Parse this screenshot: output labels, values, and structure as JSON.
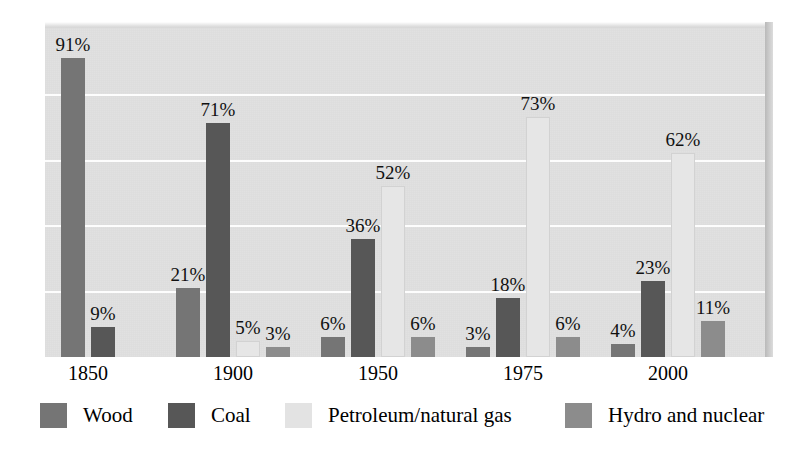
{
  "chart_data": {
    "type": "bar",
    "title": "",
    "subtitle": "",
    "xlabel": "",
    "ylabel": "",
    "ylim": [
      0,
      100
    ],
    "grid": true,
    "gridlines": [
      20,
      40,
      60,
      80
    ],
    "legend_position": "bottom",
    "value_suffix": "%",
    "categories": [
      "1850",
      "1900",
      "1950",
      "1975",
      "2000"
    ],
    "series": [
      {
        "name": "Wood",
        "color": "#757575",
        "values": [
          91,
          21,
          6,
          3,
          4
        ]
      },
      {
        "name": "Coal",
        "color": "#575757",
        "values": [
          9,
          71,
          36,
          18,
          23
        ]
      },
      {
        "name": "Petroleum/natural gas",
        "color": "#e6e6e6",
        "values": [
          null,
          5,
          52,
          73,
          62
        ]
      },
      {
        "name": "Hydro and nuclear",
        "color": "#8c8c8c",
        "values": [
          null,
          3,
          6,
          6,
          11
        ]
      }
    ],
    "groups": [
      {
        "category": "1850",
        "bars": [
          {
            "series": "Wood",
            "value": 91,
            "label": "91%"
          },
          {
            "series": "Coal",
            "value": 9,
            "label": "9%"
          }
        ]
      },
      {
        "category": "1900",
        "bars": [
          {
            "series": "Wood",
            "value": 21,
            "label": "21%"
          },
          {
            "series": "Coal",
            "value": 71,
            "label": "71%"
          },
          {
            "series": "Petroleum/natural gas",
            "value": 5,
            "label": "5%"
          },
          {
            "series": "Hydro and nuclear",
            "value": 3,
            "label": "3%"
          }
        ]
      },
      {
        "category": "1950",
        "bars": [
          {
            "series": "Wood",
            "value": 6,
            "label": "6%"
          },
          {
            "series": "Coal",
            "value": 36,
            "label": "36%"
          },
          {
            "series": "Petroleum/natural gas",
            "value": 52,
            "label": "52%"
          },
          {
            "series": "Hydro and nuclear",
            "value": 6,
            "label": "6%"
          }
        ]
      },
      {
        "category": "1975",
        "bars": [
          {
            "series": "Wood",
            "value": 3,
            "label": "3%"
          },
          {
            "series": "Coal",
            "value": 18,
            "label": "18%"
          },
          {
            "series": "Petroleum/natural gas",
            "value": 73,
            "label": "73%"
          },
          {
            "series": "Hydro and nuclear",
            "value": 6,
            "label": "6%"
          }
        ]
      },
      {
        "category": "2000",
        "bars": [
          {
            "series": "Wood",
            "value": 4,
            "label": "4%"
          },
          {
            "series": "Coal",
            "value": 23,
            "label": "23%"
          },
          {
            "series": "Petroleum/natural gas",
            "value": 62,
            "label": "62%"
          },
          {
            "series": "Hydro and nuclear",
            "value": 11,
            "label": "11%"
          }
        ]
      }
    ]
  },
  "axis": {
    "x_tick_labels": [
      "1850",
      "1900",
      "1950",
      "1975",
      "2000"
    ]
  },
  "legend": {
    "items": [
      {
        "label": "Wood",
        "swatch": "wood",
        "color": "#757575"
      },
      {
        "label": "Coal",
        "swatch": "coal",
        "color": "#575757"
      },
      {
        "label": "Petroleum/natural gas",
        "swatch": "petroleum",
        "color": "#e3e3e3"
      },
      {
        "label": "Hydro and nuclear",
        "swatch": "hydro",
        "color": "#8c8c8c"
      }
    ]
  },
  "colors": {
    "plot_background": "#e1e1e1",
    "gridline": "#fdfdfd",
    "page_background": "#ffffff",
    "text": "#000000"
  }
}
